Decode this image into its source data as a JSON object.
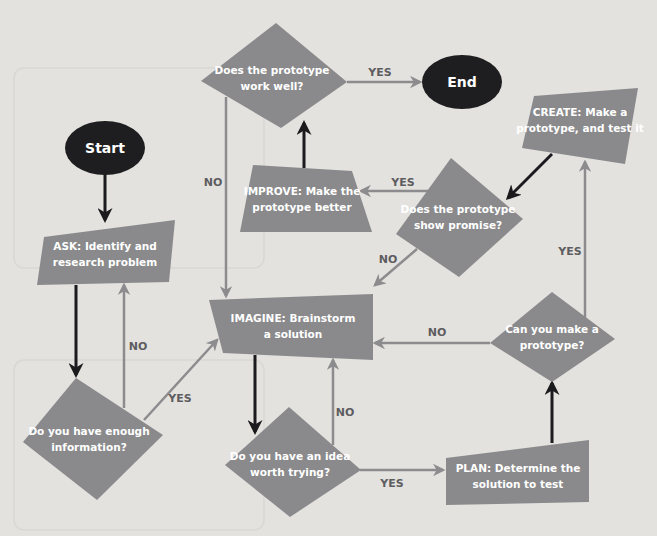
{
  "diagram": {
    "type": "flowchart",
    "colors": {
      "background": "#e4e2df",
      "process_fill": "#8a8a8c",
      "terminal_fill": "#1e1e20",
      "dark_arrow": "#1b1b1d",
      "gray_arrow": "#8c8c8e",
      "label_text": "#5d5d60",
      "node_text": "#ffffff"
    },
    "nodes": {
      "start": {
        "label": "Start",
        "shape": "ellipse"
      },
      "end": {
        "label": "End",
        "shape": "ellipse"
      },
      "ask": {
        "line1": "ASK: Identify and",
        "line2": "research problem",
        "shape": "quadrilateral"
      },
      "enough_info": {
        "line1": "Do you have enough",
        "line2": "information?",
        "shape": "diamond"
      },
      "imagine": {
        "line1": "IMAGINE: Brainstorm",
        "line2": "a solution",
        "shape": "quadrilateral"
      },
      "idea_worth": {
        "line1": "Do you have an idea",
        "line2": "worth trying?",
        "shape": "diamond"
      },
      "plan": {
        "line1": "PLAN: Determine the",
        "line2": "solution to test",
        "shape": "quadrilateral"
      },
      "can_make": {
        "line1": "Can you make a",
        "line2": "prototype?",
        "shape": "diamond"
      },
      "create": {
        "line1": "CREATE: Make a",
        "line2": "prototype, and test it",
        "shape": "quadrilateral"
      },
      "show_promise": {
        "line1": "Does the prototype",
        "line2": "show promise?",
        "shape": "diamond"
      },
      "improve": {
        "line1": "IMPROVE: Make the",
        "line2": "prototype better",
        "shape": "trapezoid"
      },
      "work_well": {
        "line1": "Does the prototype",
        "line2": "work well?",
        "shape": "diamond"
      }
    },
    "edges": [
      {
        "from": "start",
        "to": "ask",
        "label": ""
      },
      {
        "from": "ask",
        "to": "enough_info",
        "label": ""
      },
      {
        "from": "enough_info",
        "to": "ask",
        "label": "NO"
      },
      {
        "from": "enough_info",
        "to": "imagine",
        "label": "YES"
      },
      {
        "from": "imagine",
        "to": "idea_worth",
        "label": ""
      },
      {
        "from": "idea_worth",
        "to": "imagine",
        "label": "NO"
      },
      {
        "from": "idea_worth",
        "to": "plan",
        "label": "YES"
      },
      {
        "from": "plan",
        "to": "can_make",
        "label": ""
      },
      {
        "from": "can_make",
        "to": "imagine",
        "label": "NO"
      },
      {
        "from": "can_make",
        "to": "create",
        "label": "YES"
      },
      {
        "from": "create",
        "to": "show_promise",
        "label": ""
      },
      {
        "from": "show_promise",
        "to": "imagine",
        "label": "NO"
      },
      {
        "from": "show_promise",
        "to": "improve",
        "label": "YES"
      },
      {
        "from": "improve",
        "to": "work_well",
        "label": ""
      },
      {
        "from": "work_well",
        "to": "imagine",
        "label": "NO"
      },
      {
        "from": "work_well",
        "to": "end",
        "label": "YES"
      }
    ],
    "edge_labels": {
      "enough_no": "NO",
      "enough_yes": "YES",
      "idea_no": "NO",
      "idea_yes": "YES",
      "canmake_no": "NO",
      "canmake_yes": "YES",
      "promise_no": "NO",
      "promise_yes": "YES",
      "workwell_no": "NO",
      "workwell_yes": "YES"
    }
  }
}
